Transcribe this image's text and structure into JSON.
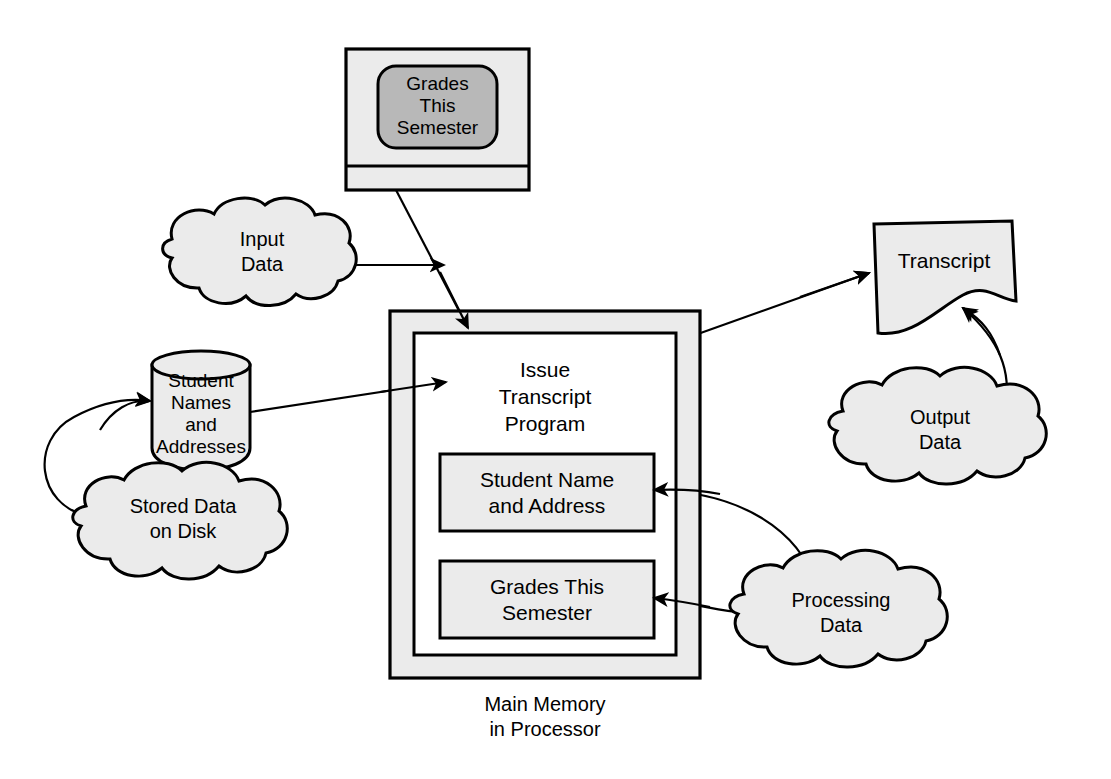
{
  "diagram": {
    "colors": {
      "shape_fill": "#ebebeb",
      "screen_fill": "#b8b8b8",
      "inner_fill": "#ffffff",
      "stroke": "#000000",
      "background": "#ffffff"
    },
    "nodes": {
      "monitor": {
        "name": "monitor",
        "screen_label_lines": [
          "Grades",
          "This",
          "Semester"
        ]
      },
      "input_cloud": {
        "name": "input-data-cloud",
        "label_lines": [
          "Input",
          "Data"
        ]
      },
      "database": {
        "name": "student-database-cylinder",
        "label_lines": [
          "Student",
          "Names",
          "and",
          "Addresses"
        ]
      },
      "stored_cloud": {
        "name": "stored-data-cloud",
        "label_lines": [
          "Stored Data",
          "on Disk"
        ]
      },
      "main_memory": {
        "name": "main-memory-box",
        "program_label_lines": [
          "Issue",
          "Transcript",
          "Program"
        ],
        "caption_lines": [
          "Main Memory",
          "in Processor"
        ],
        "sub_boxes": [
          {
            "name": "student-name-address-box",
            "label_lines": [
              "Student Name",
              "and Address"
            ]
          },
          {
            "name": "grades-this-semester-box",
            "label_lines": [
              "Grades This",
              "Semester"
            ]
          }
        ]
      },
      "transcript": {
        "name": "transcript-document",
        "label": "Transcript"
      },
      "output_cloud": {
        "name": "output-data-cloud",
        "label_lines": [
          "Output",
          "Data"
        ]
      },
      "processing_cloud": {
        "name": "processing-data-cloud",
        "label_lines": [
          "Processing",
          "Data"
        ]
      }
    },
    "edges": [
      {
        "name": "edge-monitor-to-memory",
        "from": "monitor",
        "to": "main-memory-box",
        "arrow": true
      },
      {
        "name": "edge-input-cloud-pointer",
        "from": "input-data-cloud",
        "to": "",
        "arrow": true
      },
      {
        "name": "edge-database-to-memory",
        "from": "student-database-cylinder",
        "to": "main-memory-box",
        "arrow": true
      },
      {
        "name": "edge-stored-cloud-to-database",
        "from": "stored-data-cloud",
        "to": "student-database-cylinder",
        "arrow": true
      },
      {
        "name": "edge-memory-to-transcript",
        "from": "main-memory-box",
        "to": "transcript-document",
        "arrow": true
      },
      {
        "name": "edge-output-cloud-to-transcript",
        "from": "output-data-cloud",
        "to": "transcript-document",
        "arrow": true
      },
      {
        "name": "edge-processing-cloud-to-student-name",
        "from": "processing-data-cloud",
        "to": "student-name-address-box",
        "arrow": true
      },
      {
        "name": "edge-processing-cloud-to-grades",
        "from": "processing-data-cloud",
        "to": "grades-this-semester-box",
        "arrow": true
      }
    ]
  }
}
